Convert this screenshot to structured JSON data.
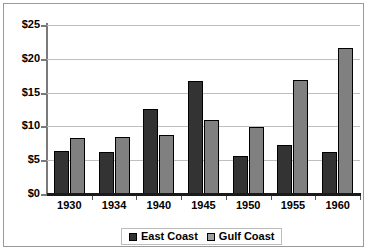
{
  "chart_data": {
    "type": "bar",
    "title": "",
    "xlabel": "",
    "ylabel": "",
    "categories": [
      "1930",
      "1934",
      "1940",
      "1945",
      "1950",
      "1955",
      "1960"
    ],
    "series": [
      {
        "name": "East Coast",
        "color": "#333333",
        "values": [
          6.3,
          6.2,
          12.6,
          16.7,
          5.6,
          7.2,
          6.2
        ]
      },
      {
        "name": "Gulf Coast",
        "color": "#808080",
        "values": [
          8.3,
          8.5,
          8.7,
          11.0,
          9.9,
          16.8,
          21.6
        ]
      }
    ],
    "ylim": [
      0,
      25
    ],
    "ytick_values": [
      0,
      5,
      10,
      15,
      20,
      25
    ],
    "ytick_labels": [
      "$0",
      "$5",
      "$10",
      "$15",
      "$20",
      "$25"
    ],
    "grid": true,
    "legend_position": "bottom-center"
  },
  "legend": {
    "entries": [
      {
        "label": "East Coast"
      },
      {
        "label": "Gulf Coast"
      }
    ]
  }
}
